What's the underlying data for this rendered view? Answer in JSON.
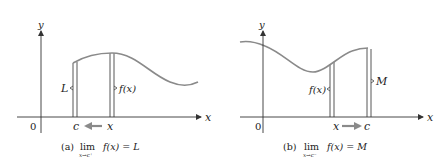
{
  "figure": {
    "colors": {
      "axis": "#333333",
      "curve": "#8a8a8a",
      "strip": "#444444",
      "arrow": "#8a8a8a",
      "text": "#222222"
    },
    "panel_a": {
      "y_axis_label": "y",
      "x_axis_label": "x",
      "origin_label": "0",
      "left_strip_label": "L",
      "right_strip_label": "f(x)",
      "c_label": "c",
      "x_label": "x",
      "arrow_direction": "left",
      "caption_tag": "(a)",
      "caption_lim": "lim",
      "caption_sub": "x→c⁺",
      "caption_expr": "f(x) = L"
    },
    "panel_b": {
      "y_axis_label": "y",
      "x_axis_label": "x",
      "origin_label": "0",
      "left_strip_label": "f(x)",
      "right_strip_label": "M",
      "x_label": "x",
      "c_label": "c",
      "arrow_direction": "right",
      "caption_tag": "(b)",
      "caption_lim": "lim",
      "caption_sub": "x→c⁻",
      "caption_expr": "f(x) = M"
    }
  }
}
